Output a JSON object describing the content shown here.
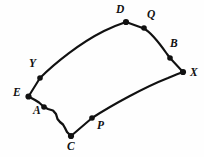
{
  "figure": {
    "type": "geometry-diagram",
    "background_color": "#fefefe",
    "stroke_color": "#111111",
    "label_color": "#111111",
    "canvas": {
      "width": 204,
      "height": 157
    },
    "vertices": [
      {
        "id": "D",
        "label": "D",
        "x": 126,
        "y": 22,
        "label_x": 116,
        "label_y": 4,
        "role": "corner",
        "dot_radius": 3.1
      },
      {
        "id": "Q",
        "label": "Q",
        "x": 144,
        "y": 28,
        "label_x": 147,
        "label_y": 9,
        "role": "marked-point",
        "dot_radius": 2.7
      },
      {
        "id": "B",
        "label": "B",
        "x": 170,
        "y": 58,
        "label_x": 170,
        "label_y": 38,
        "role": "marked-point",
        "dot_radius": 2.7
      },
      {
        "id": "X",
        "label": "X",
        "x": 183,
        "y": 72,
        "label_x": 190,
        "label_y": 67,
        "role": "corner",
        "dot_radius": 3.1
      },
      {
        "id": "P",
        "label": "P",
        "x": 92,
        "y": 118,
        "label_x": 97,
        "label_y": 120,
        "role": "marked-point",
        "dot_radius": 2.7
      },
      {
        "id": "C",
        "label": "C",
        "x": 71,
        "y": 136,
        "label_x": 67,
        "label_y": 141,
        "role": "corner",
        "dot_radius": 3.1
      },
      {
        "id": "A",
        "label": "A",
        "x": 44,
        "y": 107,
        "label_x": 33,
        "label_y": 105,
        "role": "marked-point",
        "dot_radius": 2.7
      },
      {
        "id": "E",
        "label": "E",
        "x": 28,
        "y": 97,
        "label_x": 13,
        "label_y": 87,
        "role": "corner",
        "dot_radius": 3.1
      },
      {
        "id": "Y",
        "label": "Y",
        "x": 40,
        "y": 78,
        "label_x": 29,
        "label_y": 58,
        "role": "marked-point",
        "dot_radius": 2.7
      }
    ],
    "edges": [
      {
        "id": "top",
        "from": "E",
        "to": "D",
        "through": [
          "Y"
        ],
        "style": "smooth-arc",
        "bow": "upward"
      },
      {
        "id": "right",
        "from": "D",
        "to": "X",
        "through": [
          "Q",
          "B"
        ],
        "style": "polyline-arc",
        "bow": "slight"
      },
      {
        "id": "bottom",
        "from": "X",
        "to": "C",
        "through": [
          "P"
        ],
        "style": "smooth-arc",
        "bow": "upward"
      },
      {
        "id": "left",
        "from": "C",
        "to": "E",
        "through": [
          "A"
        ],
        "style": "zigzag",
        "bow": "none"
      }
    ]
  }
}
